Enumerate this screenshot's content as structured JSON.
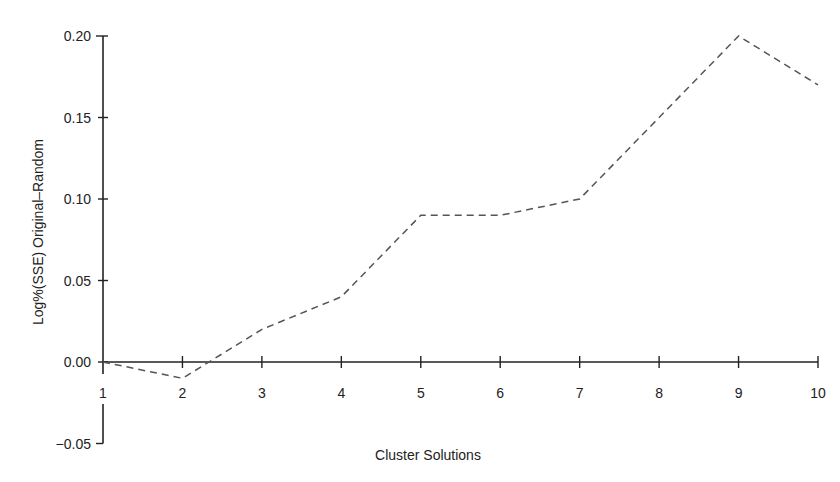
{
  "chart_data": {
    "type": "line",
    "title": "",
    "xlabel": "Cluster Solutions",
    "ylabel": "Log%(SSE) Original–Random",
    "x": [
      1,
      2,
      3,
      4,
      5,
      6,
      7,
      8,
      9,
      10
    ],
    "categories": [
      "1",
      "2",
      "3",
      "4",
      "5",
      "6",
      "7",
      "8",
      "9",
      "10"
    ],
    "series": [
      {
        "name": "Log%(SSE) Original-Random",
        "style": "dashed",
        "values": [
          0.0,
          -0.01,
          0.02,
          0.04,
          0.09,
          0.09,
          0.1,
          0.15,
          0.2,
          0.17
        ]
      }
    ],
    "yticks": [
      "0.20",
      "0.15",
      "0.10",
      "0.05",
      "0.00",
      "−0.05"
    ],
    "ytick_values": [
      0.2,
      0.15,
      0.1,
      0.05,
      0.0,
      -0.05
    ],
    "xticks": [
      "1",
      "2",
      "3",
      "4",
      "5",
      "6",
      "7",
      "8",
      "9",
      "10"
    ],
    "ylim": [
      -0.05,
      0.2
    ],
    "xlim": [
      1,
      10
    ],
    "grid": false,
    "legend": null
  },
  "colors": {
    "axis": "#222222",
    "line": "#555555",
    "text": "#222222"
  }
}
